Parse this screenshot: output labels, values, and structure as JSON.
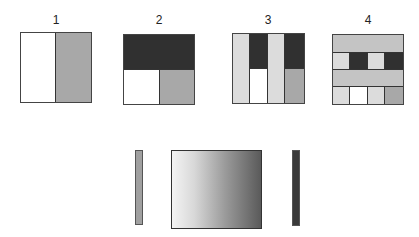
{
  "colors": {
    "white": "#ffffff",
    "light": "#dcdcdc",
    "mid": "#a8a8a8",
    "dark": "#303030",
    "border": "#333333"
  },
  "panels": [
    {
      "label": "1",
      "description": "two vertical halves: white | gray"
    },
    {
      "label": "2",
      "description": "dark top half; bottom: white | gray"
    },
    {
      "label": "3",
      "description": "four columns: light | dark-over-white | light | dark-over-gray"
    },
    {
      "label": "4",
      "description": "four rows: light band; light|dark|light|dark; light band; light|white|light|gray"
    }
  ],
  "bottom": {
    "left_bar": "gray swatch",
    "gradient": "white-to-dark horizontal gradient",
    "right_bar": "dark swatch"
  }
}
